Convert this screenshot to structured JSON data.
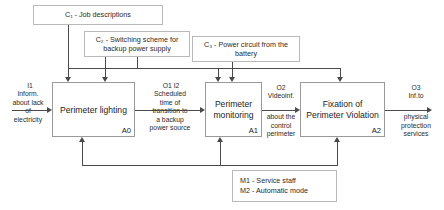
{
  "diagram": {
    "type": "IDEF0 function model",
    "controls": [
      {
        "id": "C1",
        "label": "C₁ - Job descriptions"
      },
      {
        "id": "C2",
        "label": "C₂ - Switching scheme for\nbackup power supply"
      },
      {
        "id": "C3",
        "label": "C₃ - Power circuit from the\nbattery"
      }
    ],
    "activities": [
      {
        "code": "A0",
        "title": "Perimeter lighting"
      },
      {
        "code": "A1",
        "title": "Perimeter\nmonitoring"
      },
      {
        "code": "A2",
        "title": "Fixation of\nPerimeter Violation"
      }
    ],
    "flows": [
      {
        "id": "I1",
        "head": "I1",
        "text": "Inform.\nabout lack\nof\nelectricity"
      },
      {
        "id": "O1I2",
        "head": "O1      I2",
        "text": "Scheduled\ntime of\ntransition to\na backup\npower source"
      },
      {
        "id": "O2",
        "head": "O2",
        "text": "Videoinf.",
        "tail": "about the\ncontrol\nperimeter"
      },
      {
        "id": "O3",
        "head": "O3",
        "text": "Inf.to",
        "tail": "physical\nprotection\nservices"
      }
    ],
    "mechanisms": {
      "label": "M1 - Service staff\nM2 - Automatic mode"
    }
  }
}
